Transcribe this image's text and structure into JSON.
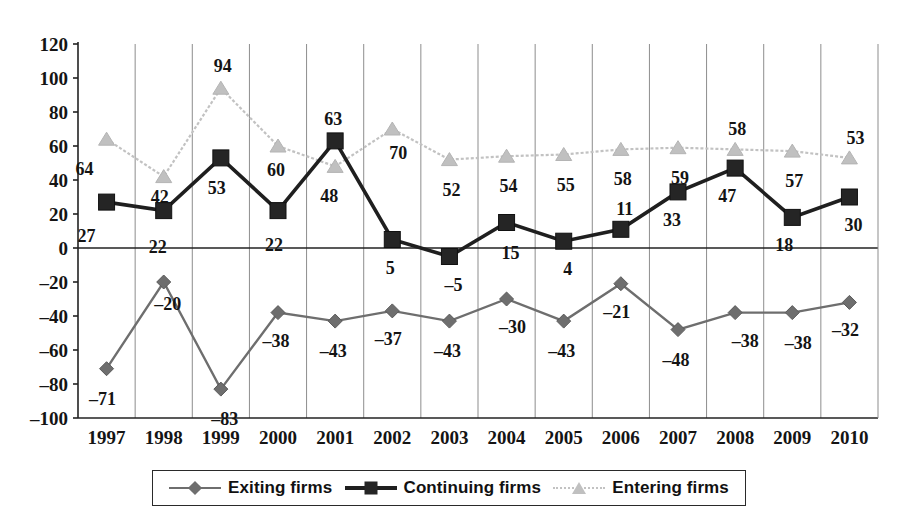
{
  "chart_data": {
    "type": "line",
    "title": "",
    "subtitle": "",
    "xlabel": "",
    "ylabel": "",
    "ylim": [
      -100,
      120
    ],
    "ytick_step": 20,
    "yticks": [
      120,
      100,
      80,
      60,
      40,
      20,
      0,
      -20,
      -40,
      -60,
      -80,
      -100
    ],
    "ytick_labels": [
      "120",
      "100",
      "80",
      "60",
      "40",
      "20",
      "0",
      "–20",
      "–40",
      "–60",
      "–80",
      "–100"
    ],
    "categories": [
      "1997",
      "1998",
      "1999",
      "2000",
      "2001",
      "2002",
      "2003",
      "2004",
      "2005",
      "2006",
      "2007",
      "2008",
      "2009",
      "2010"
    ],
    "grid": "vertical",
    "legend_position": "bottom",
    "zero_line": true,
    "series": [
      {
        "name": "Exiting firms",
        "marker": "diamond",
        "color": "#6e6e6e",
        "values": [
          -71,
          -20,
          -83,
          -38,
          -43,
          -37,
          -43,
          -30,
          -43,
          -21,
          -48,
          -38,
          -38,
          -32
        ],
        "labels": [
          "–71",
          "–20",
          "–83",
          "–38",
          "–43",
          "–37",
          "–43",
          "–30",
          "–43",
          "–21",
          "–48",
          "–38",
          "–38",
          "–32"
        ]
      },
      {
        "name": "Continuing firms",
        "marker": "square",
        "color": "#252525",
        "values": [
          27,
          22,
          53,
          22,
          63,
          5,
          -5,
          15,
          4,
          11,
          33,
          47,
          18,
          30
        ],
        "labels": [
          "27",
          "22",
          "53",
          "22",
          "63",
          "5",
          "–5",
          "15",
          "4",
          "11",
          "33",
          "47",
          "18",
          "30"
        ]
      },
      {
        "name": "Entering firms",
        "marker": "triangle",
        "color": "#c0c0c0",
        "values": [
          64,
          42,
          94,
          60,
          48,
          70,
          52,
          54,
          55,
          58,
          59,
          58,
          57,
          53
        ],
        "labels": [
          "64",
          "42",
          "94",
          "60",
          "48",
          "70",
          "52",
          "54",
          "55",
          "58",
          "59",
          "58",
          "57",
          "53"
        ]
      }
    ]
  },
  "legend": {
    "items": [
      {
        "label": "Exiting firms",
        "marker": "diamond"
      },
      {
        "label": "Continuing firms",
        "marker": "square"
      },
      {
        "label": "Entering firms",
        "marker": "triangle"
      }
    ]
  },
  "colors": {
    "exiting": "#6e6e6e",
    "continuing": "#252525",
    "entering": "#c0c0c0",
    "grid": "#8d8d8d",
    "axis": "#222222",
    "background": "#ffffff"
  }
}
